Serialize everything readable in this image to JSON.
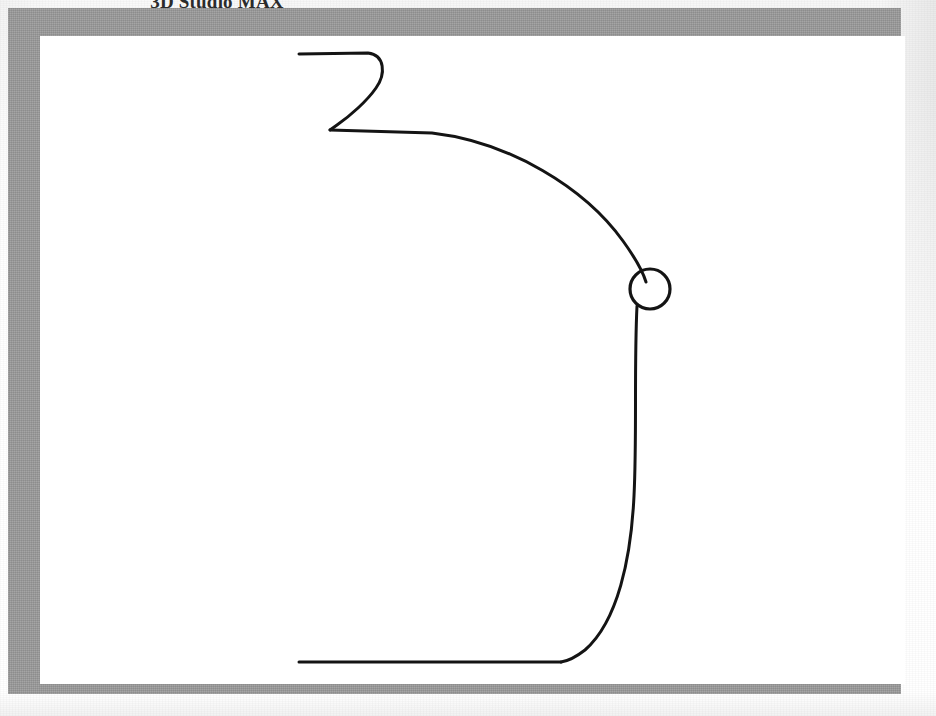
{
  "page": {
    "background_color": "#f4f4f4",
    "width": 936,
    "height": 716
  },
  "figure": {
    "title": "3D Studio MAX",
    "title_clipped_at_top": true,
    "frame_color": "#9a9a9a",
    "canvas_color": "#ffffff",
    "stroke_color": "#141414",
    "stroke_width": 3
  },
  "drawing": {
    "name": "hand-drawn-profile-spline",
    "description": "Open spline profile curve with a small closed circular loop at the right side",
    "elements": [
      {
        "name": "top-zigzag-segment",
        "type": "path",
        "d": "M 259 18 L 328 17 C 345 19 345 38 336 52 C 328 64 312 78 300 87 L 290 94 L 497 96"
      },
      {
        "name": "upper-arc-segment",
        "type": "path",
        "d": "M 290 94 C 400 100 520 140 585 205 C 600 220 606 232 608 245"
      },
      {
        "name": "small-circle-loop",
        "type": "circle",
        "cx": 610,
        "cy": 253,
        "r": 20
      },
      {
        "name": "right-vertical-bulge-segment",
        "type": "path",
        "d": "M 598 268 C 594 340 596 430 589 500 C 583 560 560 605 520 626"
      },
      {
        "name": "bottom-horizontal-segment",
        "type": "path",
        "d": "M 520 626 L 259 626"
      }
    ]
  }
}
